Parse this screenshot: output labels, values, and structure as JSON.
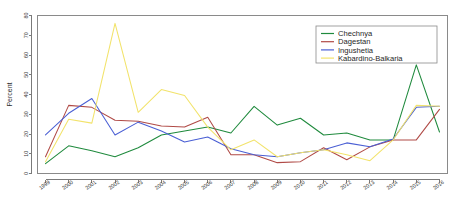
{
  "chart_data": {
    "type": "line",
    "title": "",
    "xlabel": "",
    "ylabel": "Percent",
    "x": [
      1999,
      2000,
      2001,
      2002,
      2003,
      2004,
      2005,
      2006,
      2007,
      2008,
      2009,
      2010,
      2011,
      2012,
      2013,
      2014,
      2015,
      2016
    ],
    "xtick_labels": [
      "1999",
      "2000",
      "2001",
      "2002",
      "2003",
      "2004",
      "2005",
      "2006",
      "2007",
      "2008",
      "2009",
      "2010",
      "2011",
      "2012",
      "2013",
      "2014",
      "2015",
      "2016"
    ],
    "ytick_labels": [
      "0",
      "10",
      "20",
      "30",
      "40",
      "50",
      "60",
      "70",
      "80"
    ],
    "yticks": [
      0,
      10,
      20,
      30,
      40,
      50,
      60,
      70,
      80
    ],
    "ylim": [
      0,
      80
    ],
    "xlim": [
      1999,
      2016
    ],
    "grid": false,
    "legend_position": "top-right",
    "series": [
      {
        "name": "Chechnya",
        "color": "#1f8a3d",
        "values": [
          5.0,
          14.0,
          11.5,
          8.5,
          13.0,
          19.5,
          21.5,
          23.5,
          20.5,
          34.0,
          24.5,
          28.0,
          19.5,
          20.5,
          17.0,
          17.0,
          55.0,
          21.0
        ]
      },
      {
        "name": "Dagestan",
        "color": "#b04a46",
        "values": [
          8.5,
          34.5,
          33.5,
          27.0,
          26.5,
          24.0,
          23.5,
          28.5,
          9.5,
          9.5,
          5.5,
          6.0,
          13.0,
          7.0,
          13.5,
          17.0,
          17.0,
          32.5
        ]
      },
      {
        "name": "Ingushetia",
        "color": "#4a5fd4",
        "values": [
          19.5,
          30.5,
          38.0,
          19.5,
          26.0,
          21.5,
          16.0,
          18.5,
          12.5,
          9.5,
          8.5,
          10.5,
          12.0,
          15.5,
          13.5,
          17.5,
          33.5,
          34.0
        ]
      },
      {
        "name": "Kabardino-Balkaria",
        "color": "#f2e36b",
        "values": [
          6.0,
          27.5,
          25.5,
          76.0,
          31.0,
          42.5,
          39.5,
          23.5,
          12.0,
          17.0,
          8.5,
          10.5,
          12.0,
          9.5,
          6.5,
          17.0,
          34.5,
          34.0
        ]
      }
    ]
  },
  "legend": {
    "entries": [
      "Chechnya",
      "Dagestan",
      "Ingushetia",
      "Kabardino-Balkaria"
    ]
  }
}
